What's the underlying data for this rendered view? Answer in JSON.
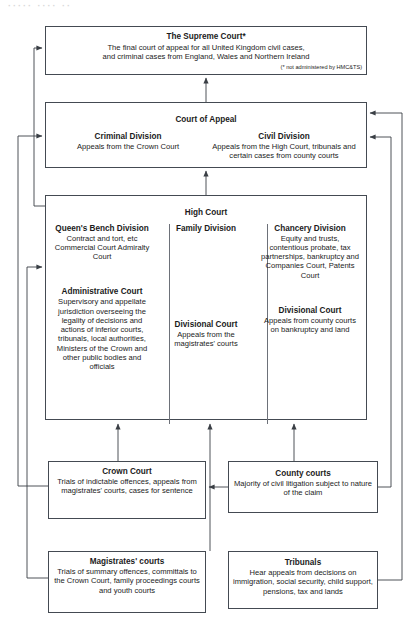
{
  "artifact": {
    "top_text": "·····  ····  ··"
  },
  "diagram": {
    "supreme_court": {
      "title": "The Supreme Court*",
      "line1": "The final court of appeal for all United Kingdom civil cases,",
      "line2": "and criminal cases from England, Wales and Northern Ireland",
      "footnote": "(* not administered by HMC&TS)"
    },
    "court_of_appeal": {
      "heading": "Court of Appeal",
      "criminal": {
        "title": "Criminal Division",
        "body": "Appeals from the Crown Court"
      },
      "civil": {
        "title": "Civil Division",
        "body": "Appeals from the High Court, tribunals and certain cases from county courts"
      }
    },
    "high_court": {
      "heading": "High Court",
      "queens_bench": {
        "title": "Queen's Bench Division",
        "body": "Contract and tort, etc Commercial Court Admiralty Court"
      },
      "administrative": {
        "title": "Administrative Court",
        "body": "Supervisory and appellate jurisdiction overseeing the legality of decisions and actions of inferior courts, tribunals, local authorities, Ministers of the Crown and other public bodies and officials"
      },
      "family": {
        "title": "Family Division",
        "body": ""
      },
      "divisional_family": {
        "title": "Divisional Court",
        "body": "Appeals from the magistrates' courts"
      },
      "chancery": {
        "title": "Chancery Division",
        "body": "Equity and trusts, contentious probate, tax partnerships, bankruptcy and Companies Court, Patents Court"
      },
      "divisional_chancery": {
        "title": "Divisional Court",
        "body": "Appeals from county courts on bankruptcy and land"
      }
    },
    "crown_court": {
      "title": "Crown Court",
      "body": "Trials of indictable offences, appeals from magistrates' courts, cases for sentence"
    },
    "county_courts": {
      "title": "County courts",
      "body": "Majority of civil litigation subject to nature of the claim"
    },
    "magistrates_courts": {
      "title": "Magistrates' courts",
      "body": "Trials of summary offences, committals to the Crown Court, family proceedings courts and youth courts"
    },
    "tribunals": {
      "title": "Tribunals",
      "body": "Hear appeals from decisions on immigration, social security, child support, pensions, tax and lands"
    }
  },
  "style": {
    "box_border": "#444a52",
    "line_color": "#3a3f45",
    "text_color": "#1b1b1b",
    "background": "#ffffff"
  },
  "connections": [
    {
      "id": "coa-to-supreme",
      "from": "court-of-appeal",
      "to": "supreme-court",
      "route": "vertical"
    },
    {
      "id": "highcourt-to-coa",
      "from": "high-court",
      "to": "court-of-appeal",
      "route": "vertical"
    },
    {
      "id": "highcourt-to-supreme",
      "from": "high-court",
      "to": "supreme-court",
      "route": "left-bypass"
    },
    {
      "id": "crown-to-coa",
      "from": "crown-court",
      "to": "court-of-appeal",
      "route": "left-bypass"
    },
    {
      "id": "magistrates-to-admin",
      "from": "magistrates-courts",
      "to": "administrative-court",
      "route": "left-bypass"
    },
    {
      "id": "crown-to-highcourt",
      "from": "crown-court",
      "to": "high-court",
      "route": "vertical"
    },
    {
      "id": "county-to-highcourt",
      "from": "county-courts",
      "to": "high-court",
      "route": "vertical"
    },
    {
      "id": "magistrates-to-divisional",
      "from": "magistrates-courts",
      "to": "divisional-court-family",
      "route": "vertical"
    },
    {
      "id": "magistrates-to-crown",
      "from": "magistrates-courts",
      "to": "crown-court",
      "route": "horizontal"
    },
    {
      "id": "county-to-coa",
      "from": "county-courts",
      "to": "court-of-appeal",
      "route": "right-bypass"
    },
    {
      "id": "tribunals-to-coa",
      "from": "tribunals",
      "to": "court-of-appeal",
      "route": "right-bypass"
    }
  ]
}
